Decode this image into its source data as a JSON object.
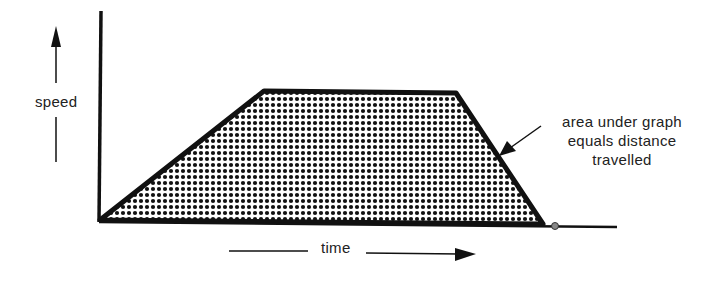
{
  "diagram": {
    "y_axis_label": "speed",
    "x_axis_label": "time",
    "annotation": {
      "lines": [
        "area under graph",
        "equals distance",
        "travelled"
      ]
    },
    "shape": "trapezoid",
    "fill_pattern": "dot-halftone",
    "colors": {
      "line": "#111111",
      "dots": "#111111",
      "background": "#ffffff",
      "text": "#222222"
    },
    "vertices": [
      {
        "name": "start",
        "x": 100,
        "y": 220
      },
      {
        "name": "accel-end",
        "x": 264,
        "y": 91
      },
      {
        "name": "decel-start",
        "x": 456,
        "y": 93
      },
      {
        "name": "stop",
        "x": 543,
        "y": 224
      }
    ]
  }
}
